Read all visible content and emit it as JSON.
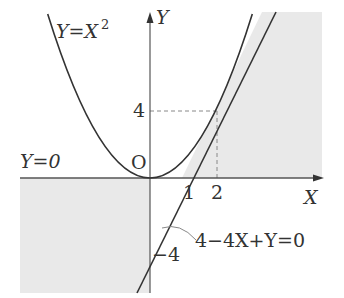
{
  "diagram": {
    "colors": {
      "ink": "#333333",
      "shade": "#e9e9e9",
      "dashed": "#888888",
      "background": "#ffffff"
    },
    "axes": {
      "x_label": "X",
      "y_label": "Y",
      "origin_label": "O"
    },
    "ticks": {
      "x_one": "1",
      "x_two": "2",
      "y_four": "4",
      "y_minus_four": "−4"
    },
    "curves": {
      "parabola": {
        "label_lhs": "Y=X",
        "label_exp": "2",
        "equation": "Y=X^2"
      },
      "tangent_line": {
        "label": "4−4X+Y=0",
        "equation": "Y=4X−4",
        "tangent_point": [
          2,
          4
        ],
        "x_intercept": 1,
        "y_intercept": -4
      },
      "x_axis_line": {
        "label": "Y=0"
      }
    },
    "shaded_regions": [
      "right of tangent line, above x-axis (Y ≥ 0, Y ≤ 4X−4)",
      "left of y-axis, below x-axis (X ≤ 0, Y ≤ 0)"
    ],
    "guides": {
      "dashed_to_point": "(2, 4)"
    }
  }
}
